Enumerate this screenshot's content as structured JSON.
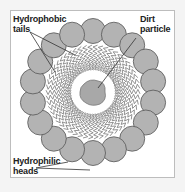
{
  "diagram": {
    "labels": {
      "tails": [
        "Hydrophobic",
        "tails"
      ],
      "dirt": [
        "Dirt",
        "particle"
      ],
      "heads": [
        "Hydrophilic",
        "heads"
      ]
    },
    "colors": {
      "head_fill": "#b3b3b3",
      "head_stroke": "#555555",
      "tail_stroke": "#777777",
      "dirt_fill": "#a8a8a8",
      "frame": "#bdbdbd"
    },
    "head_count": 18
  }
}
